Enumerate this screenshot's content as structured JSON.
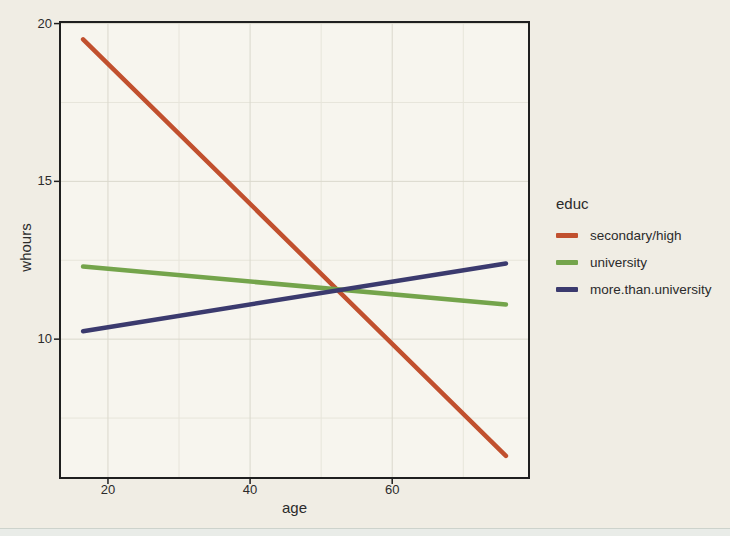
{
  "colors": {
    "page_bg": "#f0ede4",
    "panel_fill": "#f7f5ee",
    "grid_major": "#dad8cc",
    "grid_minor": "#e7e5da",
    "border": "#1f1f1f",
    "text": "#2b2b2b",
    "red_line": "#c1502e",
    "green_line": "#74a44b",
    "navy_line": "#3b3a6e"
  },
  "chart_data": {
    "type": "line",
    "title": "",
    "xlabel": "age",
    "ylabel": "whours",
    "legend_title": "educ",
    "legend_position": "right",
    "grid": "major+minor",
    "x_range_panel": [
      13.25,
      79.25
    ],
    "y_range_panel": [
      5.6,
      20.05
    ],
    "x_ticks": [
      20,
      40,
      60
    ],
    "y_ticks": [
      10,
      15,
      20
    ],
    "x_minor_gridlines": [
      30,
      50,
      70
    ],
    "y_minor_gridlines": [
      7.5,
      12.5,
      17.5
    ],
    "series": [
      {
        "name": "secondary/high",
        "color": "#c1502e",
        "x": [
          16.5,
          76
        ],
        "y": [
          19.5,
          6.3
        ]
      },
      {
        "name": "university",
        "color": "#74a44b",
        "x": [
          16.5,
          76
        ],
        "y": [
          12.3,
          11.1
        ]
      },
      {
        "name": "more.than.university",
        "color": "#3b3a6e",
        "x": [
          16.5,
          76
        ],
        "y": [
          10.25,
          12.4
        ]
      }
    ]
  }
}
